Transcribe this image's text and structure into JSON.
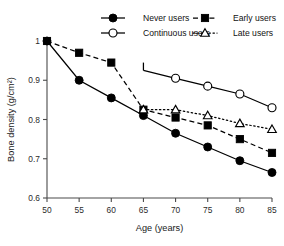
{
  "chart_data": {
    "type": "line",
    "title": "",
    "xlabel": "Age (years)",
    "ylabel": "Bone density (g/cm²)",
    "xlim": [
      50,
      85
    ],
    "ylim": [
      0.6,
      1.0
    ],
    "xticks": [
      50,
      55,
      60,
      65,
      70,
      75,
      80,
      85
    ],
    "xticklabels": [
      "50",
      "55",
      "60",
      "65",
      "70",
      "75",
      "80",
      "85"
    ],
    "yticks": [
      0.6,
      0.7,
      0.8,
      0.9,
      1.0
    ],
    "yticklabels": [
      "0.6",
      "0.7",
      "0.8",
      "0.9",
      "1"
    ],
    "grid": false,
    "legend_position": "top",
    "series": [
      {
        "name": "Never users",
        "marker": "filled-circle",
        "linestyle": "solid",
        "color": "#000000",
        "x": [
          50,
          55,
          60,
          65,
          70,
          75,
          80,
          85
        ],
        "values": [
          1.0,
          0.9,
          0.855,
          0.81,
          0.765,
          0.73,
          0.695,
          0.665
        ]
      },
      {
        "name": "Continuous users",
        "marker": "open-circle",
        "linestyle": "solid",
        "color": "#000000",
        "x": [
          65,
          70,
          75,
          80,
          85
        ],
        "values": [
          0.925,
          0.905,
          0.885,
          0.865,
          0.83
        ]
      },
      {
        "name": "Early users",
        "marker": "filled-square",
        "linestyle": "dashed",
        "color": "#000000",
        "x": [
          50,
          55,
          60,
          65,
          70,
          75,
          80,
          85
        ],
        "values": [
          1.0,
          0.97,
          0.945,
          0.825,
          0.805,
          0.785,
          0.75,
          0.715
        ]
      },
      {
        "name": "Late users",
        "marker": "open-triangle",
        "linestyle": "dotted",
        "color": "#000000",
        "x": [
          65,
          70,
          75,
          80,
          85
        ],
        "values": [
          0.825,
          0.825,
          0.81,
          0.79,
          0.775
        ]
      }
    ]
  },
  "legend": {
    "entries": [
      {
        "label": "Never users",
        "marker": "filled-circle",
        "linestyle": "solid"
      },
      {
        "label": "Early users",
        "marker": "filled-square",
        "linestyle": "dashed"
      },
      {
        "label": "Continuous users",
        "marker": "open-circle",
        "linestyle": "solid"
      },
      {
        "label": "Late users",
        "marker": "open-triangle",
        "linestyle": "dotted"
      }
    ]
  }
}
